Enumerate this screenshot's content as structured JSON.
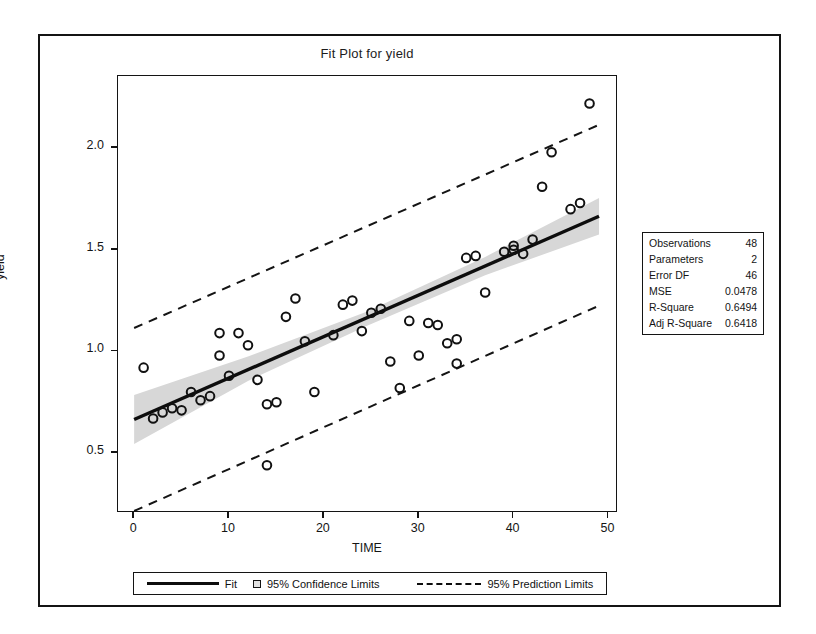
{
  "figure": {
    "title": "Fit Plot for yield"
  },
  "axes": {
    "x": {
      "label": "TIME",
      "ticks": [
        "0",
        "10",
        "20",
        "30",
        "40",
        "50"
      ],
      "tick_values": [
        0,
        10,
        20,
        30,
        40,
        50
      ],
      "range": [
        -1.7,
        51.0
      ]
    },
    "y": {
      "label": "yield",
      "ticks": [
        "0.5",
        "1.0",
        "1.5",
        "2.0"
      ],
      "tick_values": [
        0.5,
        1.0,
        1.5,
        2.0
      ],
      "range": [
        0.205,
        2.355
      ]
    }
  },
  "stats": {
    "rows": [
      {
        "label": "Observations",
        "value": "48"
      },
      {
        "label": "Parameters",
        "value": "2"
      },
      {
        "label": "Error DF",
        "value": "46"
      },
      {
        "label": "MSE",
        "value": "0.0478"
      },
      {
        "label": "R-Square",
        "value": "0.6494"
      },
      {
        "label": "Adj R-Square",
        "value": "0.6418"
      }
    ]
  },
  "legend": {
    "fit_label": "Fit",
    "confidence_label": "95% Confidence Limits",
    "prediction_label": "95% Prediction Limits"
  },
  "colors": {
    "fit_line": "#0d0d0d",
    "confidence_band": "#d7d7d7",
    "prediction_line": "#141414",
    "marker_stroke": "#111111",
    "frame": "#141414",
    "background": "#ffffff"
  },
  "chart_data": {
    "type": "scatter",
    "title": "Fit Plot for yield",
    "xlabel": "TIME",
    "ylabel": "yield",
    "xlim": [
      -1.7,
      51.0
    ],
    "ylim": [
      0.205,
      2.355
    ],
    "grid": false,
    "legend_position": "bottom",
    "series": [
      {
        "name": "Observations",
        "type": "scatter",
        "marker": "open-circle",
        "points": [
          {
            "x": 1,
            "y": 0.92
          },
          {
            "x": 2,
            "y": 0.67
          },
          {
            "x": 3,
            "y": 0.7
          },
          {
            "x": 4,
            "y": 0.72
          },
          {
            "x": 5,
            "y": 0.71
          },
          {
            "x": 6,
            "y": 0.8
          },
          {
            "x": 7,
            "y": 0.76
          },
          {
            "x": 8,
            "y": 0.78
          },
          {
            "x": 9,
            "y": 1.09
          },
          {
            "x": 9,
            "y": 0.98
          },
          {
            "x": 10,
            "y": 0.88
          },
          {
            "x": 11,
            "y": 1.09
          },
          {
            "x": 12,
            "y": 1.03
          },
          {
            "x": 13,
            "y": 0.86
          },
          {
            "x": 14,
            "y": 0.44
          },
          {
            "x": 14,
            "y": 0.74
          },
          {
            "x": 15,
            "y": 0.75
          },
          {
            "x": 16,
            "y": 1.17
          },
          {
            "x": 17,
            "y": 1.26
          },
          {
            "x": 18,
            "y": 1.05
          },
          {
            "x": 19,
            "y": 0.8
          },
          {
            "x": 21,
            "y": 1.08
          },
          {
            "x": 22,
            "y": 1.23
          },
          {
            "x": 23,
            "y": 1.25
          },
          {
            "x": 24,
            "y": 1.1
          },
          {
            "x": 25,
            "y": 1.19
          },
          {
            "x": 26,
            "y": 1.21
          },
          {
            "x": 27,
            "y": 0.95
          },
          {
            "x": 28,
            "y": 0.82
          },
          {
            "x": 29,
            "y": 1.15
          },
          {
            "x": 30,
            "y": 0.98
          },
          {
            "x": 31,
            "y": 1.14
          },
          {
            "x": 32,
            "y": 1.13
          },
          {
            "x": 33,
            "y": 1.04
          },
          {
            "x": 34,
            "y": 0.94
          },
          {
            "x": 34,
            "y": 1.06
          },
          {
            "x": 35,
            "y": 1.46
          },
          {
            "x": 36,
            "y": 1.47
          },
          {
            "x": 37,
            "y": 1.29
          },
          {
            "x": 39,
            "y": 1.49
          },
          {
            "x": 40,
            "y": 1.52
          },
          {
            "x": 40,
            "y": 1.5
          },
          {
            "x": 41,
            "y": 1.48
          },
          {
            "x": 42,
            "y": 1.55
          },
          {
            "x": 43,
            "y": 1.81
          },
          {
            "x": 44,
            "y": 1.98
          },
          {
            "x": 46,
            "y": 1.7
          },
          {
            "x": 47,
            "y": 1.73
          },
          {
            "x": 48,
            "y": 2.22
          }
        ]
      },
      {
        "name": "Fit",
        "type": "line",
        "endpoints": [
          {
            "x": 0,
            "y": 0.665
          },
          {
            "x": 49,
            "y": 1.665
          }
        ],
        "slope": 0.0204,
        "intercept": 0.665
      },
      {
        "name": "95% Confidence Limits",
        "type": "band",
        "lower": [
          {
            "x": 0,
            "y": 0.545
          },
          {
            "x": 12,
            "y": 0.855
          },
          {
            "x": 24.5,
            "y": 1.125
          },
          {
            "x": 37,
            "y": 1.375
          },
          {
            "x": 49,
            "y": 1.575
          }
        ],
        "upper": [
          {
            "x": 0,
            "y": 0.785
          },
          {
            "x": 12,
            "y": 0.975
          },
          {
            "x": 24.5,
            "y": 1.195
          },
          {
            "x": 37,
            "y": 1.465
          },
          {
            "x": 49,
            "y": 1.755
          }
        ]
      },
      {
        "name": "95% Prediction Limits",
        "type": "line-dashed-pair",
        "lower": [
          {
            "x": 0,
            "y": 0.215
          },
          {
            "x": 49,
            "y": 1.225
          }
        ],
        "upper": [
          {
            "x": 0,
            "y": 1.115
          },
          {
            "x": 49,
            "y": 2.115
          }
        ]
      }
    ]
  }
}
